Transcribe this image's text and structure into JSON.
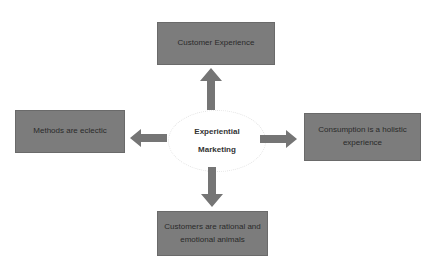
{
  "diagram": {
    "center": {
      "line1": "Experiential",
      "line2": "Marketing"
    },
    "nodes": {
      "top": "Customer Experience",
      "left": "Methods are eclectic",
      "right": "Consumption is a holistic experience",
      "bottom": "Customers are rational and emotional animals"
    },
    "colors": {
      "box": "#7c7c7c",
      "arrow": "#757575",
      "background": "#ffffff"
    }
  }
}
